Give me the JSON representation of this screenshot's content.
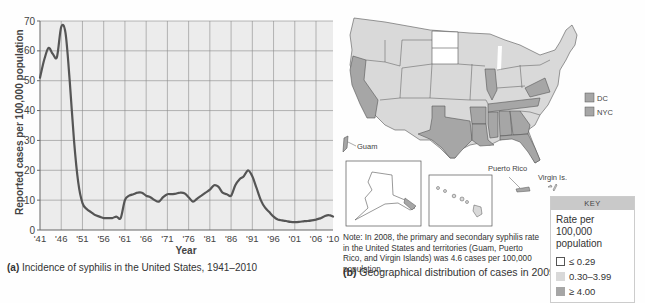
{
  "chart_data": [
    {
      "type": "line",
      "title": "Incidence of syphilis in the United States, 1941–2010",
      "panel_label": "(a)",
      "xlabel": "Year",
      "ylabel": "Reported cases per 100,000 population",
      "xlim": [
        1941,
        2010
      ],
      "ylim": [
        0,
        70
      ],
      "grid": true,
      "x_tick_labels": [
        "'41",
        "'46",
        "'51",
        "'56",
        "'61",
        "'66",
        "'71",
        "'76",
        "'81",
        "'86",
        "'91",
        "'96",
        "'01",
        "'06",
        "'10"
      ],
      "x_ticks": [
        1941,
        1946,
        1951,
        1956,
        1961,
        1966,
        1971,
        1976,
        1981,
        1986,
        1991,
        1996,
        2001,
        2006,
        2010
      ],
      "y_ticks": [
        0,
        10,
        20,
        30,
        40,
        50,
        60,
        70
      ],
      "series": [
        {
          "name": "Reported cases per 100,000 population",
          "x": [
            1941,
            1942,
            1943,
            1944,
            1945,
            1946,
            1947,
            1948,
            1949,
            1950,
            1951,
            1952,
            1953,
            1954,
            1955,
            1956,
            1957,
            1958,
            1959,
            1960,
            1961,
            1962,
            1963,
            1964,
            1965,
            1966,
            1967,
            1968,
            1969,
            1970,
            1971,
            1972,
            1973,
            1974,
            1975,
            1976,
            1977,
            1978,
            1979,
            1980,
            1981,
            1982,
            1983,
            1984,
            1985,
            1986,
            1987,
            1988,
            1989,
            1990,
            1991,
            1992,
            1993,
            1994,
            1995,
            1996,
            1997,
            1998,
            1999,
            2000,
            2001,
            2002,
            2003,
            2004,
            2005,
            2006,
            2007,
            2008,
            2009,
            2010
          ],
          "values": [
            51,
            57,
            61,
            59,
            58,
            68,
            66,
            50,
            30,
            16,
            9,
            7,
            6,
            5,
            4.5,
            4,
            4,
            4,
            4.5,
            4,
            10,
            11.5,
            12,
            12.5,
            12.5,
            11.5,
            11,
            10,
            9.5,
            11,
            12,
            12,
            12.2,
            12.5,
            12.3,
            11,
            9.5,
            10.5,
            11.5,
            12.5,
            13.5,
            15,
            14.5,
            12.5,
            12,
            11.5,
            15,
            17,
            18,
            20,
            18,
            14,
            10,
            7.5,
            6,
            4.5,
            3.5,
            3.2,
            3,
            2.7,
            2.6,
            2.7,
            2.9,
            3,
            3.2,
            3.5,
            3.9,
            4.6,
            5,
            4.5
          ]
        }
      ]
    },
    {
      "type": "map",
      "title": "Geographical distribution of cases in 2009",
      "panel_label": "(b)",
      "key_title": "Rate per 100,000 population",
      "key_classes": [
        {
          "label": "≤ 0.29",
          "color": "#ffffff"
        },
        {
          "label": "0.30–3.99",
          "color": "#d9d9d9"
        },
        {
          "label": "≥ 4.00",
          "color": "#a6a6a6"
        }
      ],
      "high_rate_regions": [
        "California",
        "Texas",
        "Louisiana",
        "Arkansas",
        "Mississippi",
        "Alabama",
        "Georgia",
        "Florida",
        "Tennessee",
        "Illinois",
        "Virginia",
        "Maryland",
        "Delaware",
        "DC",
        "NYC",
        "Guam",
        "Puerto Rico"
      ],
      "low_rate_regions": [
        "North Dakota",
        "South Dakota",
        "Alaska"
      ]
    }
  ],
  "panel_a": {
    "caption_label": "(a)",
    "caption_text": " Incidence of syphilis in the United States, 1941–2010",
    "xlabel": "Year",
    "ylabel": "Reported cases per 100,000 population"
  },
  "panel_b": {
    "caption_label": "(b)",
    "caption_text": " Geographical distribution of cases in 2009",
    "note": "Note: In 2008, the primary and secondary syphilis rate in the United States and territories (Guam, Puerto Rico, and Virgin Islands) was 4.6 cases per 100,000 population.",
    "labels": {
      "guam": "Guam",
      "puerto_rico": "Puerto Rico",
      "virgin_islands": "Virgin Is.",
      "dc": "DC",
      "nyc": "NYC"
    },
    "key": {
      "header": "KEY",
      "title": "Rate per 100,000 population",
      "items": [
        {
          "label": "≤ 0.29"
        },
        {
          "label": "0.30–3.99"
        },
        {
          "label": "≥ 4.00"
        }
      ]
    }
  },
  "colors": {
    "plot_bg": "#ececec",
    "grid": "#8a8a8a",
    "line": "#555555",
    "map_low": "#ffffff",
    "map_mid": "#d9d9d9",
    "map_high": "#a6a6a6",
    "map_border": "#555555"
  }
}
